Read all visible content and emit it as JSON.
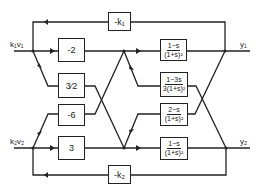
{
  "diagram": {
    "type": "block-diagram",
    "inputs": [
      {
        "id": "in1",
        "label": "k₁v₁"
      },
      {
        "id": "in2",
        "label": "k₂v₂"
      }
    ],
    "outputs": [
      {
        "id": "y1",
        "label": "y₁"
      },
      {
        "id": "y2",
        "label": "y₂"
      }
    ],
    "gains": {
      "feedback_top": "-k₁",
      "feedback_bottom": "-k₂",
      "g11": "-2",
      "g12": "3⁄2",
      "g21": "-6",
      "g22": "3"
    },
    "transfer_functions": [
      {
        "id": "tf1",
        "num": "1−s",
        "den": "(1+s)²"
      },
      {
        "id": "tf2",
        "num": "1−3s",
        "den": "3(1+s)²"
      },
      {
        "id": "tf3",
        "num": "2−s",
        "den": "(1+s)²"
      },
      {
        "id": "tf4",
        "num": "1−s",
        "den": "(1+s)²"
      }
    ],
    "colors": {
      "line": "#222222",
      "background": "#ffffff"
    }
  }
}
